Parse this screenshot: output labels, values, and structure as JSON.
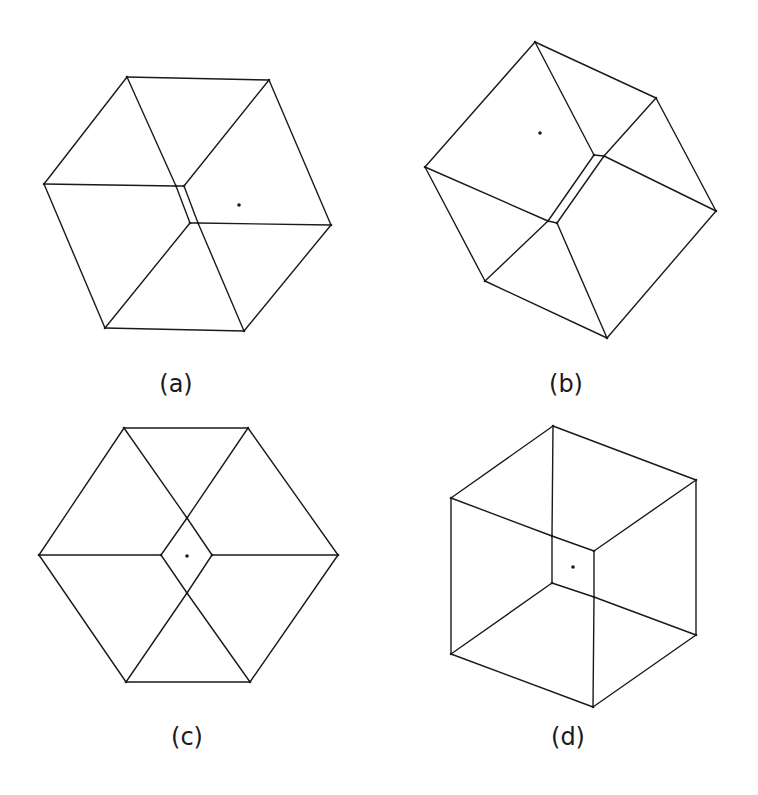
{
  "figures": [
    {
      "id": "a",
      "label": "(a)",
      "label_pos": [
        176,
        392
      ],
      "vertices": {
        "o1": [
          127,
          77
        ],
        "o2": [
          269,
          80
        ],
        "o3": [
          331,
          225
        ],
        "o4": [
          244,
          331
        ],
        "o5": [
          105,
          328
        ],
        "o6": [
          44,
          184
        ],
        "i1": [
          176,
          186
        ],
        "i2": [
          184,
          186
        ],
        "i3": [
          198,
          223
        ],
        "i4": [
          190,
          223
        ]
      },
      "edges": [
        [
          "o1",
          "o2"
        ],
        [
          "o2",
          "o3"
        ],
        [
          "o3",
          "o4"
        ],
        [
          "o4",
          "o5"
        ],
        [
          "o5",
          "o6"
        ],
        [
          "o6",
          "o1"
        ],
        [
          "o6",
          "i1"
        ],
        [
          "o1",
          "i1"
        ],
        [
          "i1",
          "i4"
        ],
        [
          "o5",
          "i4"
        ],
        [
          "o2",
          "i2"
        ],
        [
          "i2",
          "i3"
        ],
        [
          "i3",
          "o3"
        ],
        [
          "i3",
          "o4"
        ],
        [
          "i1",
          "i2"
        ],
        [
          "i4",
          "i3"
        ]
      ],
      "center_dot": [
        239,
        205
      ]
    },
    {
      "id": "b",
      "label": "(b)",
      "label_pos": [
        566,
        392
      ],
      "vertices": {
        "o1": [
          535,
          42
        ],
        "o2": [
          656,
          98
        ],
        "o3": [
          716,
          211
        ],
        "o4": [
          607,
          338
        ],
        "o5": [
          485,
          281
        ],
        "o6": [
          425,
          167
        ],
        "i1": [
          594,
          155
        ],
        "i2": [
          604,
          156
        ],
        "i3": [
          557,
          223
        ],
        "i4": [
          548,
          221
        ]
      },
      "edges": [
        [
          "o1",
          "o2"
        ],
        [
          "o2",
          "o3"
        ],
        [
          "o3",
          "o4"
        ],
        [
          "o4",
          "o5"
        ],
        [
          "o5",
          "o6"
        ],
        [
          "o6",
          "o1"
        ],
        [
          "o1",
          "i1"
        ],
        [
          "i1",
          "i2"
        ],
        [
          "o2",
          "i2"
        ],
        [
          "i2",
          "o3"
        ],
        [
          "o6",
          "i4"
        ],
        [
          "i4",
          "i3"
        ],
        [
          "i3",
          "o4"
        ],
        [
          "i4",
          "o5"
        ],
        [
          "i1",
          "i4"
        ],
        [
          "i2",
          "i3"
        ]
      ],
      "center_dot": [
        540,
        133
      ]
    },
    {
      "id": "c",
      "label": "(c)",
      "label_pos": [
        187,
        745
      ],
      "vertices": {
        "o1": [
          124,
          428
        ],
        "o2": [
          248,
          428
        ],
        "o3": [
          338,
          555
        ],
        "o4": [
          250,
          682
        ],
        "o5": [
          126,
          682
        ],
        "o6": [
          39,
          555
        ],
        "i1": [
          187,
          518
        ],
        "i2": [
          212,
          555
        ],
        "i3": [
          187,
          593
        ],
        "i4": [
          161,
          555
        ]
      },
      "edges": [
        [
          "o1",
          "o2"
        ],
        [
          "o2",
          "o3"
        ],
        [
          "o3",
          "o4"
        ],
        [
          "o4",
          "o5"
        ],
        [
          "o5",
          "o6"
        ],
        [
          "o6",
          "o1"
        ],
        [
          "o1",
          "i1"
        ],
        [
          "o2",
          "i1"
        ],
        [
          "i1",
          "i2"
        ],
        [
          "i2",
          "o3"
        ],
        [
          "i1",
          "i4"
        ],
        [
          "i4",
          "o6"
        ],
        [
          "i4",
          "i3"
        ],
        [
          "i2",
          "i3"
        ],
        [
          "i3",
          "o5"
        ],
        [
          "i3",
          "o4"
        ]
      ],
      "center_dot": [
        187,
        556
      ]
    },
    {
      "id": "d",
      "label": "(d)",
      "label_pos": [
        568,
        745
      ],
      "vertices": {
        "o1": [
          553,
          426
        ],
        "o2": [
          696,
          480
        ],
        "o3": [
          696,
          635
        ],
        "o4": [
          593,
          707
        ],
        "o5": [
          451,
          654
        ],
        "o6": [
          451,
          498
        ],
        "i1": [
          552,
          536
        ],
        "i2": [
          594,
          551
        ],
        "i3": [
          594,
          597
        ],
        "i4": [
          552,
          583
        ]
      },
      "edges": [
        [
          "o1",
          "o2"
        ],
        [
          "o2",
          "o3"
        ],
        [
          "o3",
          "o4"
        ],
        [
          "o4",
          "o5"
        ],
        [
          "o5",
          "o6"
        ],
        [
          "o6",
          "o1"
        ],
        [
          "o1",
          "i1"
        ],
        [
          "o6",
          "i1"
        ],
        [
          "i1",
          "i2"
        ],
        [
          "o2",
          "i2"
        ],
        [
          "i1",
          "i4"
        ],
        [
          "i2",
          "i3"
        ],
        [
          "i4",
          "i3"
        ],
        [
          "i3",
          "o3"
        ],
        [
          "i3",
          "o4"
        ],
        [
          "i4",
          "o5"
        ]
      ],
      "center_dot": [
        573,
        567
      ]
    }
  ],
  "stray_marks": [
    [
      148,
      380
    ],
    [
      93,
      447
    ]
  ]
}
